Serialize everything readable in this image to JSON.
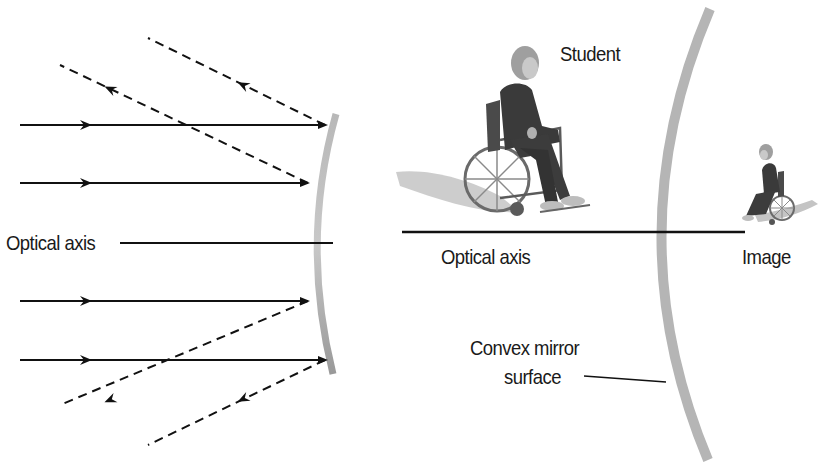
{
  "left_panel": {
    "title": "Concave-style reflection of parallel rays (diverging from convex mirror)",
    "optical_axis_label": "Optical axis",
    "incident_rays": [
      {
        "y": 125,
        "x1": 20,
        "x2": 325
      },
      {
        "y": 183,
        "x1": 20,
        "x2": 308
      },
      {
        "y": 301,
        "x1": 20,
        "x2": 308
      },
      {
        "y": 360,
        "x1": 20,
        "x2": 325
      }
    ],
    "reflected_rays": [
      {
        "x1": 325,
        "y1": 125,
        "x2": 148,
        "y2": 38
      },
      {
        "x1": 308,
        "y1": 183,
        "x2": 60,
        "y2": 65
      },
      {
        "x1": 308,
        "y1": 301,
        "x2": 60,
        "y2": 405
      },
      {
        "x1": 325,
        "y1": 360,
        "x2": 148,
        "y2": 445
      }
    ]
  },
  "right_panel": {
    "object_label": "Student",
    "optical_axis_label": "Optical axis",
    "image_label": "Image",
    "mirror_label_line1": "Convex mirror",
    "mirror_label_line2": "surface"
  },
  "colors": {
    "ray": "#111111",
    "mirror": "#a9a9a9",
    "text": "#1a1a1a",
    "figure_body": "#3a3a3a",
    "figure_hair": "#9a9a9a",
    "shadow": "#bdbdbd"
  }
}
